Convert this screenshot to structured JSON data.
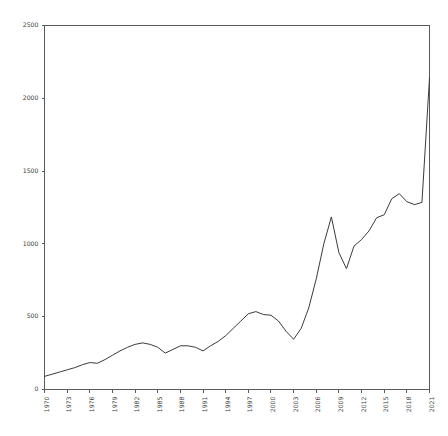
{
  "chart_data": {
    "type": "line",
    "title": "",
    "subtitle": "",
    "xlabel": "",
    "ylabel": "",
    "grid": false,
    "legend": false,
    "xlim": [
      1970,
      2021
    ],
    "ylim": [
      0,
      2500
    ],
    "ytick_labels": [
      "0",
      "500",
      "1000",
      "1500",
      "2000",
      "2500"
    ],
    "yticks": [
      0,
      500,
      1000,
      1500,
      2000,
      2500
    ],
    "xtick_labels": [
      "1970",
      "1973",
      "1976",
      "1979",
      "1982",
      "1985",
      "1988",
      "1991",
      "1994",
      "1997",
      "2000",
      "2003",
      "2006",
      "2009",
      "2012",
      "2015",
      "2018",
      "2021"
    ],
    "xticks": [
      1970,
      1973,
      1976,
      1979,
      1982,
      1985,
      1988,
      1991,
      1994,
      1997,
      2000,
      2003,
      2006,
      2009,
      2012,
      2015,
      2018,
      2021
    ],
    "line_color": "#3b3b3b",
    "axis_color": "#5a5a5a",
    "background_color": "#ffffff",
    "x": [
      1970,
      1971,
      1972,
      1973,
      1974,
      1975,
      1976,
      1977,
      1978,
      1979,
      1980,
      1981,
      1982,
      1983,
      1984,
      1985,
      1986,
      1987,
      1988,
      1989,
      1990,
      1991,
      1992,
      1993,
      1994,
      1995,
      1996,
      1997,
      1998,
      1999,
      2000,
      2001,
      2002,
      2003,
      2004,
      2005,
      2006,
      2007,
      2008,
      2009,
      2010,
      2011,
      2012,
      2013,
      2014,
      2015,
      2016,
      2017,
      2018,
      2019,
      2020,
      2021
    ],
    "values": [
      90,
      105,
      120,
      135,
      150,
      170,
      185,
      180,
      205,
      235,
      265,
      290,
      310,
      320,
      310,
      290,
      250,
      275,
      300,
      300,
      290,
      265,
      300,
      330,
      370,
      420,
      470,
      520,
      535,
      515,
      510,
      470,
      400,
      345,
      420,
      560,
      760,
      1000,
      1185,
      940,
      830,
      985,
      1030,
      1090,
      1180,
      1200,
      1310,
      1345,
      1290,
      1270,
      1285,
      2140
    ]
  }
}
